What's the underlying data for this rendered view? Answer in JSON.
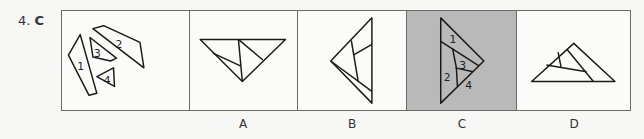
{
  "question": {
    "number": "4.",
    "answer": "C"
  },
  "panels": [
    {
      "id": "given",
      "label": "",
      "pieces": [
        "1",
        "2",
        "3",
        "4"
      ]
    },
    {
      "id": "A",
      "label": "A"
    },
    {
      "id": "B",
      "label": "B"
    },
    {
      "id": "C",
      "label": "C",
      "selected": true,
      "pieces": [
        "1",
        "2",
        "3",
        "4"
      ]
    },
    {
      "id": "D",
      "label": "D"
    }
  ],
  "colors": {
    "selected_panel": "#b9b9b9",
    "border": "#6a6a6a",
    "stroke": "#1a1a1a"
  }
}
